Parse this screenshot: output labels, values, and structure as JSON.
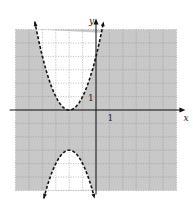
{
  "chart_data": {
    "type": "line",
    "title": "",
    "xlabel": "x",
    "ylabel": "y",
    "xlim": [
      -6,
      6
    ],
    "ylim": [
      -6,
      6
    ],
    "grid": true,
    "tick_labels": {
      "x": "1",
      "y": "1"
    },
    "series": [
      {
        "name": "upper boundary",
        "equation": "y = (x + 2)^2",
        "style": "dashed",
        "vertex": [
          -2,
          0
        ],
        "opens": "up"
      },
      {
        "name": "lower boundary",
        "equation": "y = -(x + 2)^2 - 3",
        "style": "dashed",
        "vertex": [
          -2,
          -3
        ],
        "opens": "down"
      }
    ],
    "shading": {
      "shaded_region": "y < (x + 2)^2 and y > -(x + 2)^2 - 3",
      "unshaded_regions": [
        "inside upper parabola",
        "inside lower parabola"
      ],
      "fill_color": "#c8c8c8"
    }
  },
  "labels": {
    "x_axis": "x",
    "y_axis": "y",
    "x_tick": "1",
    "y_tick": "1"
  },
  "colors": {
    "shade": "#c8c8c8",
    "grid": "#8a8a8a",
    "curve": "#111111",
    "axis": "#111111"
  }
}
